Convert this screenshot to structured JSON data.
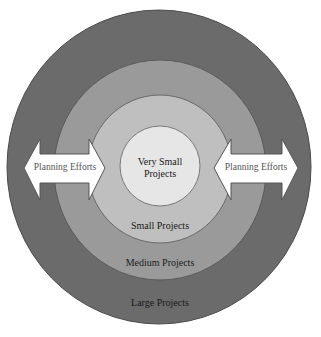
{
  "diagram": {
    "type": "concentric-circles",
    "rings": [
      {
        "id": "large",
        "label": "Large Projects",
        "color": "#6b6b6b",
        "stroke": "#4a4a4a"
      },
      {
        "id": "medium",
        "label": "Medium Projects",
        "color": "#9a9a9a",
        "stroke": "#5a5a5a"
      },
      {
        "id": "small",
        "label": "Small Projects",
        "color": "#bfbfbf",
        "stroke": "#6a6a6a"
      },
      {
        "id": "very_small",
        "label_line1": "Very Small",
        "label_line2": "Projects",
        "color": "#e6e6e6",
        "stroke": "#7a7a7a"
      }
    ],
    "arrows": [
      {
        "id": "left",
        "label": "Planning Efforts",
        "fill": "#ffffff",
        "stroke": "#555555",
        "direction": "double-headed"
      },
      {
        "id": "right",
        "label": "Planning Efforts",
        "fill": "#ffffff",
        "stroke": "#555555",
        "direction": "double-headed"
      }
    ]
  }
}
